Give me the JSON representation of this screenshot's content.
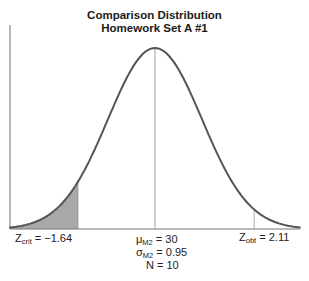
{
  "chart_data": {
    "type": "area",
    "title": "Comparison Distribution",
    "subtitle": "Homework Set A #1",
    "distribution": "normal",
    "mean": 30,
    "mean_label": {
      "symbol": "μ",
      "sub": "M2",
      "value": "= 30"
    },
    "sd_label": {
      "symbol": "σ",
      "sub": "M2",
      "value": "= 0.95"
    },
    "n_label": "N = 10",
    "z_crit": -1.64,
    "z_crit_label": {
      "symbol": "Z",
      "sub": "crit",
      "value": "= −1.64"
    },
    "z_obt": 2.11,
    "z_obt_label": {
      "symbol": "Z",
      "sub": "obt",
      "value": "= 2.11"
    },
    "shaded_region": "left tail below Z_crit",
    "x_range_z": [
      -3,
      3
    ],
    "colors": {
      "curve": "#555555",
      "shade": "#a9a9a9",
      "axis": "#777777"
    }
  }
}
